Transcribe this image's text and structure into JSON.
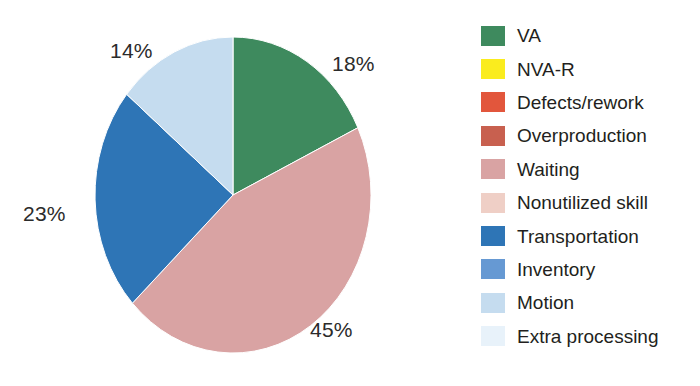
{
  "chart_data": {
    "type": "pie",
    "title": "",
    "subtitle": "",
    "xlabel": "",
    "ylabel": "",
    "grid": false,
    "legend_position": "right",
    "start_angle_deg": 0,
    "direction": "clockwise",
    "categories": [
      "VA",
      "NVA-R",
      "Defects/rework",
      "Overproduction",
      "Waiting",
      "Nonutilized skill",
      "Transportation",
      "Inventory",
      "Motion",
      "Extra processing"
    ],
    "values": [
      18,
      0,
      0,
      0,
      45,
      0,
      23,
      0,
      14,
      0
    ],
    "value_unit": "%",
    "colors": [
      "#3E8A5E",
      "#FAEC1E",
      "#E2563C",
      "#C8604F",
      "#D9A3A3",
      "#EFCFC6",
      "#2E75B6",
      "#6699D3",
      "#C5DCEF",
      "#E8F2FA"
    ],
    "slices": [
      {
        "label": "VA",
        "value": 18,
        "display": "18%",
        "color": "#3E8A5E"
      },
      {
        "label": "Waiting",
        "value": 45,
        "display": "45%",
        "color": "#D9A3A3"
      },
      {
        "label": "Transportation",
        "value": 23,
        "display": "23%",
        "color": "#2E75B6"
      },
      {
        "label": "Motion",
        "value": 14,
        "display": "14%",
        "color": "#C5DCEF"
      }
    ],
    "data_labels": [
      "18%",
      "45%",
      "23%",
      "14%"
    ]
  },
  "labels": {
    "va_pct": "18%",
    "waiting_pct": "45%",
    "transportation_pct": "23%",
    "motion_pct": "14%"
  },
  "legend": {
    "items": [
      {
        "label": "VA",
        "color": "#3E8A5E"
      },
      {
        "label": "NVA-R",
        "color": "#FAEC1E"
      },
      {
        "label": "Defects/rework",
        "color": "#E2563C"
      },
      {
        "label": "Overproduction",
        "color": "#C8604F"
      },
      {
        "label": "Waiting",
        "color": "#D9A3A3"
      },
      {
        "label": "Nonutilized skill",
        "color": "#EFCFC6"
      },
      {
        "label": "Transportation",
        "color": "#2E75B6"
      },
      {
        "label": "Inventory",
        "color": "#6699D3"
      },
      {
        "label": "Motion",
        "color": "#C5DCEF"
      },
      {
        "label": "Extra processing",
        "color": "#E8F2FA"
      }
    ]
  }
}
